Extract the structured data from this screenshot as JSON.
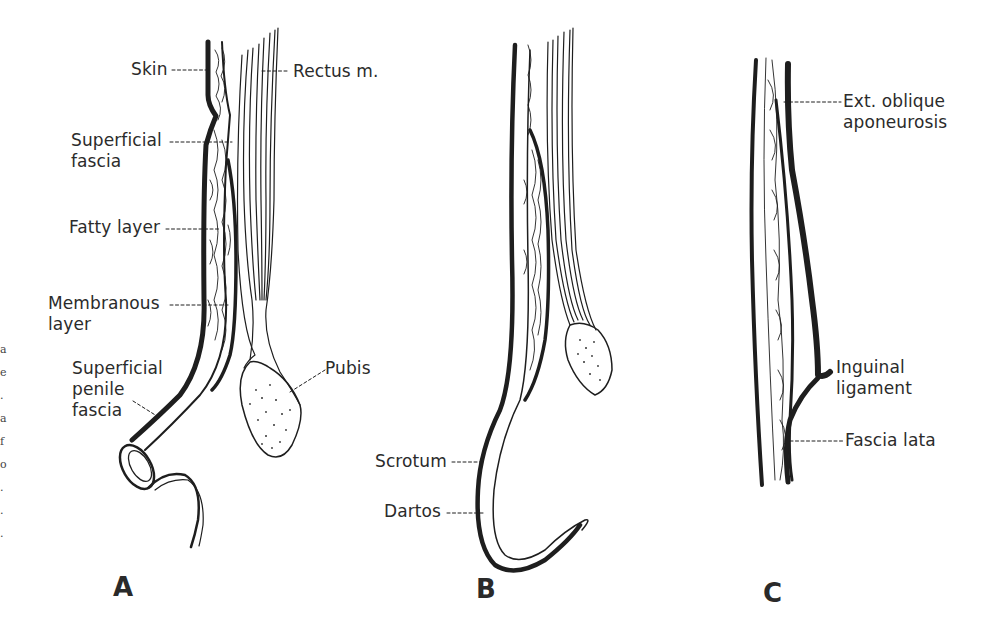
{
  "figure": {
    "panels": [
      {
        "letter": "A",
        "labels": {
          "skin": "Skin",
          "rectus": "Rectus m.",
          "superficial_fascia_1": "Superficial",
          "superficial_fascia_2": "fascia",
          "fatty_layer": "Fatty layer",
          "membranous_1": "Membranous",
          "membranous_2": "layer",
          "penile_1": "Superficial",
          "penile_2": "penile",
          "penile_3": "fascia",
          "pubis": "Pubis"
        }
      },
      {
        "letter": "B",
        "labels": {
          "scrotum": "Scrotum",
          "dartos": "Dartos"
        }
      },
      {
        "letter": "C",
        "labels": {
          "ext_oblique_1": "Ext. oblique",
          "ext_oblique_2": "aponeurosis",
          "inguinal_1": "Inguinal",
          "inguinal_2": "ligament",
          "fascia_lata": "Fascia lata"
        }
      }
    ],
    "edge_fragments": [
      "a",
      "e",
      ".",
      "a",
      "f",
      "o",
      ".",
      ".",
      "."
    ],
    "colors": {
      "ink": "#1e1e1e",
      "background": "#ffffff"
    }
  }
}
